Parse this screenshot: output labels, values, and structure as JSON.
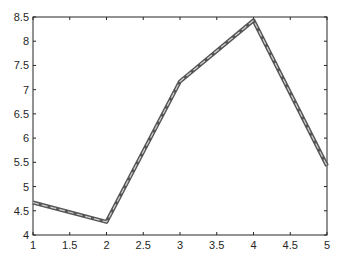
{
  "chart_data": {
    "type": "line",
    "title": "",
    "xlabel": "",
    "ylabel": "",
    "x": [
      1,
      2,
      3,
      4,
      5
    ],
    "series": [
      {
        "name": "",
        "values": [
          4.67,
          4.27,
          7.17,
          8.43,
          5.43
        ]
      }
    ],
    "xlim": [
      1,
      5
    ],
    "ylim": [
      4,
      8.5
    ],
    "xticks": [
      "1",
      "1.5",
      "2",
      "2.5",
      "3",
      "3.5",
      "4",
      "4.5",
      "5"
    ],
    "yticks": [
      "4",
      "4.5",
      "5",
      "5.5",
      "6",
      "6.5",
      "7",
      "7.5",
      "8",
      "8.5"
    ],
    "grid": false,
    "line_color": "#555555"
  }
}
